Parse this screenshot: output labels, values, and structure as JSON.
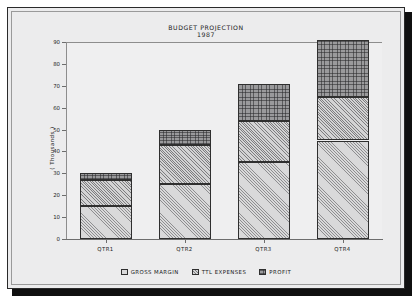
{
  "chart_data": {
    "type": "bar",
    "stacked": true,
    "title": "BUDGET PROJECTION",
    "subtitle": "1987",
    "xlabel": "",
    "ylabel": "( Thousands )",
    "categories": [
      "QTR1",
      "QTR2",
      "QTR3",
      "QTR4"
    ],
    "series": [
      {
        "name": "GROSS MARGIN",
        "values": [
          15,
          25,
          35,
          45
        ]
      },
      {
        "name": "TTL EXPENSES",
        "values": [
          12,
          18,
          19,
          20
        ]
      },
      {
        "name": "PROFIT",
        "values": [
          3,
          7,
          17,
          26
        ]
      }
    ],
    "totals": [
      30,
      50,
      71,
      91
    ],
    "ylim": [
      0,
      90
    ],
    "yticks": [
      0,
      10,
      20,
      30,
      40,
      50,
      60,
      70,
      80,
      90
    ],
    "ytick_labels": [
      "0",
      "10",
      "20",
      "30",
      "40",
      "50",
      "60",
      "70",
      "80",
      "90"
    ],
    "grid": false,
    "legend_position": "bottom",
    "colors": {
      "gross_margin": "#d9d9da",
      "ttl_expenses": "#d3d3d4",
      "profit": "#9a9a9c",
      "outline": "#2f2f2f",
      "axis": "#6d6d6d",
      "plot_background": "#efeff0",
      "page_background": "#ececed",
      "frame": "#2a2a2a",
      "text": "#1b1b1b"
    }
  },
  "legend": {
    "items": [
      {
        "label": "GROSS MARGIN",
        "pattern": "diagonal-hatch-light"
      },
      {
        "label": "TTL EXPENSES",
        "pattern": "diagonal-hatch-dense"
      },
      {
        "label": "PROFIT",
        "pattern": "stipple-dark"
      }
    ]
  }
}
